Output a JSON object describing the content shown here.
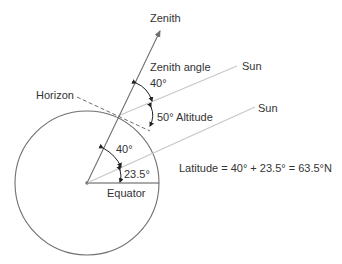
{
  "diagram": {
    "labels": {
      "zenith": "Zenith",
      "zenith_angle": "Zenith angle",
      "zenith_angle_value": "40°",
      "horizon": "Horizon",
      "altitude": "50° Altitude",
      "sun_upper": "Sun",
      "sun_lower": "Sun",
      "central_angle": "40°",
      "tilt_angle": "23.5°",
      "equator": "Equator",
      "latitude_formula": "Latitude = 40° + 23.5° = 63.5°N"
    },
    "values": {
      "zenith_angle_deg": 40,
      "altitude_deg": 50,
      "central_angle_deg": 40,
      "declination_deg": 23.5,
      "latitude_deg": 63.5,
      "latitude_hemisphere": "N"
    },
    "colors": {
      "line": "#6f6f6f",
      "sun_ray": "#c8c8c8",
      "text": "#333333",
      "arc_arrow": "#222222"
    }
  }
}
